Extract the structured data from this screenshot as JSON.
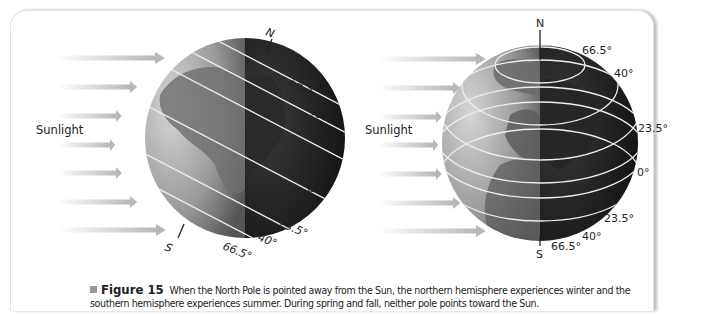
{
  "figure": {
    "number_label": "Figure 15",
    "caption_text": "When the North Pole is pointed away from the Sun, the northern hemisphere experiences winter and the southern hemisphere experiences summer. During spring and fall, neither pole points toward the Sun.",
    "colors": {
      "arrow": "#c8c8c8",
      "globe_light": "#b8b8b8",
      "globe_dark": "#1a1a1a",
      "latitude_line": "#f0f0f0",
      "bullet": "#9a9a9a"
    }
  },
  "left_globe": {
    "sunlight_label": "Sunlight",
    "north_label": "N",
    "south_label": "S",
    "latitudes_north": [
      "66.5°",
      "40°",
      "23.5°"
    ],
    "equator": "0°",
    "latitudes_south": [
      "23.5°",
      "40°",
      "66.5°"
    ]
  },
  "right_globe": {
    "sunlight_label": "Sunlight",
    "north_label": "N",
    "south_label": "S",
    "latitudes_north": [
      "66.5°",
      "40°",
      "23.5°"
    ],
    "equator": "0°",
    "latitudes_south": [
      "23.5°",
      "40°",
      "66.5°"
    ]
  }
}
